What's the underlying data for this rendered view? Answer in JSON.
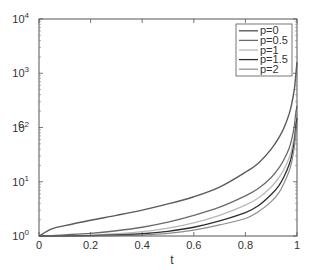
{
  "chart_data": {
    "type": "line",
    "title": "",
    "xlabel": "t",
    "ylabel": "c",
    "xlim": [
      0,
      1
    ],
    "ylim": [
      1,
      10000
    ],
    "yscale": "log",
    "grid": false,
    "legend_position": "upper right",
    "x_ticks": [
      {
        "value": 0,
        "label": "0"
      },
      {
        "value": 0.2,
        "label": "0.2"
      },
      {
        "value": 0.4,
        "label": "0.4"
      },
      {
        "value": 0.6,
        "label": "0.6"
      },
      {
        "value": 0.8,
        "label": "0.8"
      },
      {
        "value": 1,
        "label": "1"
      }
    ],
    "y_ticks": [
      {
        "value": 1,
        "base": "10",
        "exp": "0"
      },
      {
        "value": 10,
        "base": "10",
        "exp": "1"
      },
      {
        "value": 100,
        "base": "10",
        "exp": "2"
      },
      {
        "value": 1000,
        "base": "10",
        "exp": "3"
      },
      {
        "value": 10000,
        "base": "10",
        "exp": "4"
      }
    ],
    "x": [
      0,
      0.05,
      0.1,
      0.2,
      0.3,
      0.4,
      0.5,
      0.6,
      0.7,
      0.8,
      0.85,
      0.9,
      0.93,
      0.95,
      0.97,
      0.98,
      0.99,
      0.995,
      1.0
    ],
    "series": [
      {
        "name": "p=0",
        "color": "#5a5a5a",
        "width": 1.4,
        "values": [
          1.0,
          1.35,
          1.55,
          1.95,
          2.4,
          3.0,
          3.9,
          5.3,
          8.0,
          15.0,
          22.0,
          40.0,
          65.0,
          100.0,
          180.0,
          280.0,
          520.0,
          900.0,
          1600.0
        ]
      },
      {
        "name": "p=0.5",
        "color": "#6a6a6a",
        "width": 1.3,
        "values": [
          1.0,
          1.02,
          1.05,
          1.12,
          1.25,
          1.45,
          1.8,
          2.4,
          3.4,
          5.5,
          7.5,
          12.0,
          18.0,
          26.0,
          42.0,
          62.0,
          110.0,
          180.0,
          250.0
        ]
      },
      {
        "name": "p=1",
        "color": "#b8b8b8",
        "width": 1.3,
        "values": [
          1.0,
          1.0,
          1.01,
          1.04,
          1.1,
          1.2,
          1.4,
          1.75,
          2.4,
          3.7,
          5.0,
          8.0,
          12.0,
          17.0,
          28.0,
          40.0,
          70.0,
          120.0,
          180.0
        ]
      },
      {
        "name": "p=1.5",
        "color": "#2e2e2e",
        "width": 1.3,
        "values": [
          1.0,
          1.0,
          1.0,
          1.02,
          1.05,
          1.1,
          1.22,
          1.45,
          1.9,
          2.7,
          3.6,
          5.8,
          8.5,
          12.5,
          21.0,
          31.0,
          56.0,
          100.0,
          150.0
        ]
      },
      {
        "name": "p=2",
        "color": "#8c8c8c",
        "width": 1.2,
        "values": [
          1.0,
          1.0,
          1.0,
          1.0,
          1.02,
          1.05,
          1.12,
          1.28,
          1.6,
          2.1,
          2.8,
          4.3,
          6.3,
          9.5,
          16.0,
          24.0,
          45.0,
          80.0,
          120.0
        ]
      }
    ]
  },
  "plot_box": {
    "left": 39,
    "right": 297,
    "top": 19,
    "bottom": 236
  },
  "legend": {
    "x": 236,
    "y": 24,
    "width": 56,
    "height": 52
  }
}
